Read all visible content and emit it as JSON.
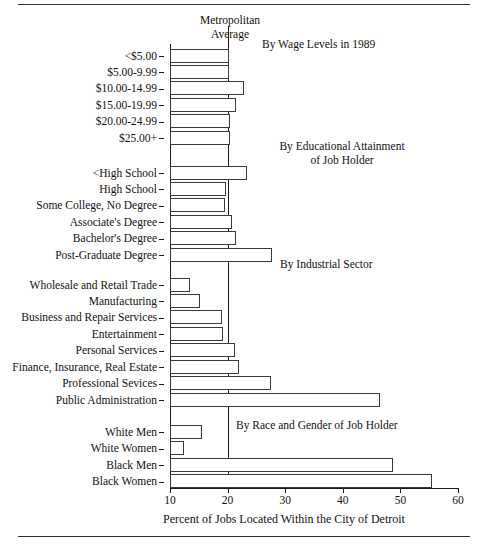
{
  "figure": {
    "metropolitan_average_label_line1": "Metropolitan",
    "metropolitan_average_label_line2": "Average",
    "x_axis_title": "Percent of Jobs Located Within the City of Detroit"
  },
  "section_headers": {
    "wage": "By Wage Levels in 1989",
    "education_line1": "By Educational Attainment",
    "education_line2": "of Job Holder",
    "industry": "By Industrial Sector",
    "race_gender": "By Race and Gender of Job Holder"
  },
  "axis": {
    "ticks": [
      "10",
      "20",
      "30",
      "40",
      "50",
      "60"
    ]
  },
  "chart_data": {
    "type": "bar",
    "orientation": "horizontal",
    "title": "",
    "xlabel": "Percent of Jobs Located Within the City of Detroit",
    "ylabel": "",
    "xlim": [
      10,
      60
    ],
    "xticks": [
      10,
      20,
      30,
      40,
      50,
      60
    ],
    "grid": false,
    "legend": null,
    "reference_line": {
      "label": "Metropolitan Average",
      "value": 20,
      "orientation": "vertical"
    },
    "groups": [
      {
        "name": "By Wage Levels in 1989",
        "categories": [
          "<$5.00",
          "$5.00-9.99",
          "$10.00-14.99",
          "$15.00-19.99",
          "$20.00-24.99",
          "$25.00+"
        ],
        "values": [
          20.2,
          20.2,
          22.8,
          21.5,
          20.4,
          20.4
        ]
      },
      {
        "name": "By Educational Attainment of Job Holder",
        "categories": [
          "<High School",
          "High School",
          "Some College, No Degree",
          "Associate's Degree",
          "Bachelor's Degree",
          "Post-Graduate Degree"
        ],
        "values": [
          23.4,
          19.7,
          19.5,
          20.8,
          21.4,
          27.7
        ]
      },
      {
        "name": "By Industrial Sector",
        "categories": [
          "Wholesale and Retail Trade",
          "Manufacturing",
          "Business and Repair Services",
          "Entertainment",
          "Personal Services",
          "Finance, Insurance, Real Estate",
          "Professional Sevices",
          "Public Administration"
        ],
        "values": [
          13.5,
          15.2,
          19.0,
          19.2,
          21.2,
          22.0,
          27.5,
          46.5
        ]
      },
      {
        "name": "By Race and Gender of Job Holder",
        "categories": [
          "White Men",
          "White Women",
          "Black Men",
          "Black Women"
        ],
        "values": [
          15.5,
          12.5,
          48.7,
          55.5
        ]
      }
    ]
  }
}
